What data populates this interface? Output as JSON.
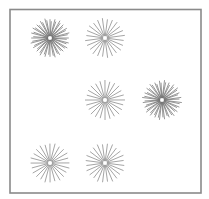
{
  "stimulus": {
    "description": "Six starburst (radial line) patterns inside a square frame",
    "frame_color": "#8a8a8a",
    "ray_color": "#7d7d7d",
    "items": [
      {
        "id": "starburst-1",
        "row": 1,
        "col": 1,
        "rays": 24,
        "layers": 2,
        "shade": "dark"
      },
      {
        "id": "starburst-2",
        "row": 1,
        "col": 2,
        "rays": 24,
        "layers": 1,
        "shade": "light"
      },
      {
        "id": "starburst-3",
        "row": 2,
        "col": 2,
        "rays": 24,
        "layers": 1,
        "shade": "light"
      },
      {
        "id": "starburst-4",
        "row": 2,
        "col": 3,
        "rays": 24,
        "layers": 2,
        "shade": "dark"
      },
      {
        "id": "starburst-5",
        "row": 3,
        "col": 1,
        "rays": 24,
        "layers": 1,
        "shade": "light"
      },
      {
        "id": "starburst-6",
        "row": 3,
        "col": 2,
        "rays": 24,
        "layers": 1,
        "shade": "light"
      }
    ]
  }
}
